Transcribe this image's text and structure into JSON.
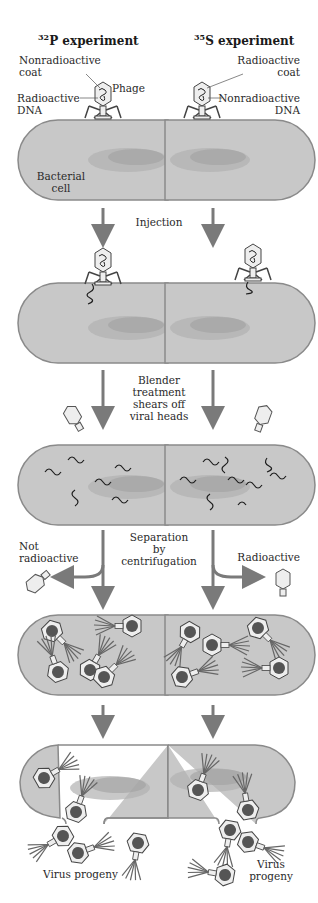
{
  "colors": {
    "cell_fill": "#c8c8c8",
    "cell_outline": "#8a8a8a",
    "arrow": "#7a7a7a",
    "nucleoid": "#a9a9a9",
    "coat_fill": "#eeeeee",
    "dna": "#1e1e1e"
  },
  "columns": {
    "left": {
      "isotope_mass": "32",
      "isotope": "P",
      "title_suffix": " experiment"
    },
    "right": {
      "isotope_mass": "35",
      "isotope": "S",
      "title_suffix": " experiment"
    }
  },
  "labels": {
    "left_coat_line1": "Nonradioactive",
    "left_coat_line2": "coat",
    "phage": "Phage",
    "left_dna_line1": "Radioactive",
    "left_dna_line2": "DNA",
    "right_coat_line1": "Radioactive",
    "right_coat_line2": "coat",
    "right_dna_line1": "Nonradioactive",
    "right_dna_line2": "DNA",
    "bacterial_line1": "Bacterial",
    "bacterial_line2": "cell"
  },
  "steps": [
    {
      "label_lines": [
        "Injection"
      ]
    },
    {
      "label_lines": [
        "Blender",
        "treatment",
        "shears off",
        "viral heads"
      ]
    },
    {
      "label_lines": [
        "Separation",
        "by",
        "centrifugation"
      ]
    }
  ],
  "outcomes": {
    "left_supernatant": [
      "Not",
      "radioactive"
    ],
    "right_supernatant": [
      "Radioactive"
    ],
    "left_progeny": "Virus progeny",
    "right_progeny_line1": "Virus",
    "right_progeny_line2": "progeny"
  }
}
